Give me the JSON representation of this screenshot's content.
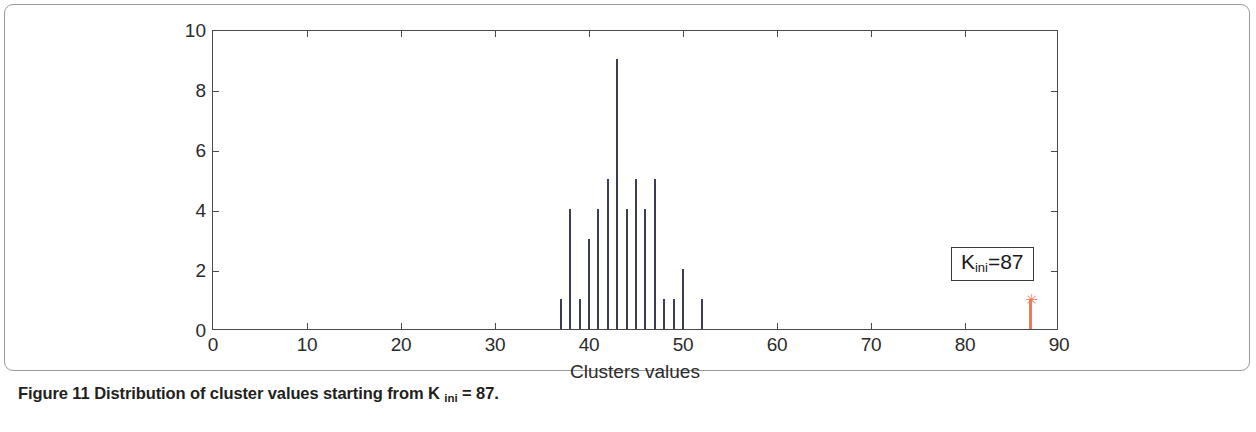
{
  "figure": {
    "caption_prefix": "Figure 11",
    "caption_text": "Distribution of cluster values starting from K",
    "caption_sub": "ini",
    "caption_suffix": "= 87."
  },
  "annotation": {
    "symbol": "K",
    "subscript": "ini",
    "equals_value": "=87",
    "full_text": "K_ini=87",
    "marker_glyph": "✳",
    "color": "#ef7a54"
  },
  "chart_data": {
    "type": "bar",
    "title": "",
    "subtitle": "",
    "xlabel": "Clusters values",
    "ylabel": "",
    "xlim": [
      0,
      90
    ],
    "ylim": [
      0,
      10
    ],
    "xticks": [
      0,
      10,
      20,
      30,
      40,
      50,
      60,
      70,
      80,
      90
    ],
    "xticklabels": [
      "0",
      "10",
      "20",
      "30",
      "40",
      "50",
      "60",
      "70",
      "80",
      "90"
    ],
    "yticks": [
      0,
      2,
      4,
      6,
      8,
      10
    ],
    "yticklabels": [
      "0",
      "2",
      "4",
      "6",
      "8",
      "10"
    ],
    "grid": false,
    "legend": null,
    "series": [
      {
        "name": "cluster value counts",
        "color": "#3a3f55",
        "x": [
          37,
          38,
          39,
          40,
          41,
          42,
          43,
          44,
          45,
          46,
          47,
          48,
          49,
          50,
          52
        ],
        "values": [
          1,
          4,
          1,
          3,
          4,
          5,
          9,
          4,
          5,
          4,
          5,
          1,
          1,
          2,
          1
        ]
      },
      {
        "name": "initial K marker",
        "color": "#ef7a54",
        "x": [
          87
        ],
        "values": [
          1
        ],
        "marker": "asterisk"
      }
    ],
    "annotations": [
      {
        "text": "K_ini=87",
        "x": 78.5,
        "y": 2.8
      }
    ]
  },
  "colors": {
    "stem": "#3a3f55",
    "highlight": "#ef7a54",
    "axis": "#4a4a4a",
    "frame": "#9a9a9a",
    "caption": "#231f20"
  }
}
